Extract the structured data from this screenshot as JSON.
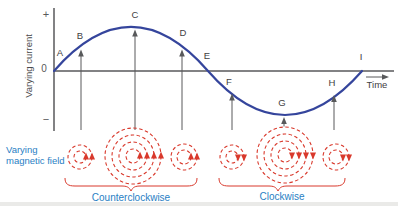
{
  "figure": {
    "y_axis_label": "Varying current",
    "x_axis_label": "Time",
    "plus_sign": "+",
    "zero_label": "0",
    "minus_sign": "−",
    "points": [
      {
        "label": "A"
      },
      {
        "label": "B"
      },
      {
        "label": "C"
      },
      {
        "label": "D"
      },
      {
        "label": "E"
      },
      {
        "label": "F"
      },
      {
        "label": "G"
      },
      {
        "label": "H"
      },
      {
        "label": "I"
      }
    ],
    "field_caption_line1": "Varying",
    "field_caption_line2": "magnetic field",
    "ccw_label": "Counterclockwise",
    "cw_label": "Clockwise",
    "colors": {
      "curve_blue": "#35459c",
      "axis_gray": "#58595b",
      "field_red": "#d9392c",
      "caption_blue": "#2980c4"
    },
    "field_groups": [
      {
        "cx": 80,
        "cy": 157,
        "radii": [
          12,
          6
        ],
        "direction": "ccw"
      },
      {
        "cx": 133,
        "cy": 156,
        "radii": [
          28,
          21,
          14,
          7
        ],
        "direction": "ccw"
      },
      {
        "cx": 184,
        "cy": 157,
        "radii": [
          13,
          7
        ],
        "direction": "ccw"
      },
      {
        "cx": 232,
        "cy": 157,
        "radii": [
          12,
          6
        ],
        "direction": "cw"
      },
      {
        "cx": 285,
        "cy": 155,
        "radii": [
          28,
          21,
          14,
          7
        ],
        "direction": "cw"
      },
      {
        "cx": 336,
        "cy": 157,
        "radii": [
          13,
          7
        ],
        "direction": "cw"
      }
    ]
  }
}
